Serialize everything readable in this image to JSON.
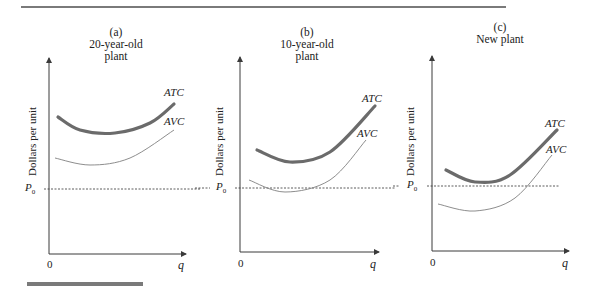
{
  "figure": {
    "panels": [
      {
        "id": "a",
        "letter": "(a)",
        "title": "20-year-old plant",
        "title_lines": [
          "20-year-old",
          "plant"
        ],
        "ylabel": "Dollars per unit",
        "price_label": "P",
        "price_sub": "0",
        "origin_label": "0",
        "xlabel": "q",
        "atc_label": "ATC",
        "avc_label": "AVC"
      },
      {
        "id": "b",
        "letter": "(b)",
        "title": "10-year-old plant",
        "title_lines": [
          "10-year-old",
          "plant"
        ],
        "ylabel": "Dollars per unit",
        "price_label": "P",
        "price_sub": "0",
        "origin_label": "0",
        "xlabel": "q",
        "atc_label": "ATC",
        "avc_label": "AVC"
      },
      {
        "id": "c",
        "letter": "(c)",
        "title": "New plant",
        "title_lines": [
          "New plant",
          ""
        ],
        "ylabel": "Dollars per unit",
        "price_label": "P",
        "price_sub": "0",
        "origin_label": "0",
        "xlabel": "q",
        "atc_label": "ATC",
        "avc_label": "AVC"
      }
    ]
  },
  "chart_data": [
    {
      "type": "line",
      "title": "(a) 20-year-old plant",
      "xlabel": "q",
      "ylabel": "Dollars per unit",
      "reference_line": {
        "label": "P0",
        "style": "dashed"
      },
      "series": [
        {
          "name": "ATC",
          "style": "thick",
          "path": [
            [
              58,
              117
            ],
            [
              80,
              130
            ],
            [
              115,
              133
            ],
            [
              150,
              123
            ],
            [
              174,
              104
            ]
          ]
        },
        {
          "name": "AVC",
          "style": "thin",
          "path": [
            [
              55,
              158
            ],
            [
              90,
              165
            ],
            [
              130,
              158
            ],
            [
              174,
              130
            ]
          ]
        }
      ],
      "note": "Both ATC and AVC lie entirely above P0"
    },
    {
      "type": "line",
      "title": "(b) 10-year-old plant",
      "xlabel": "q",
      "ylabel": "Dollars per unit",
      "reference_line": {
        "label": "P0",
        "style": "dashed"
      },
      "series": [
        {
          "name": "ATC",
          "style": "thick",
          "path": [
            [
              257,
              150
            ],
            [
              290,
              162
            ],
            [
              330,
              152
            ],
            [
              375,
              106
            ]
          ]
        },
        {
          "name": "AVC",
          "style": "thin",
          "path": [
            [
              249,
              180
            ],
            [
              285,
              192
            ],
            [
              330,
              180
            ],
            [
              366,
              140
            ]
          ]
        }
      ],
      "note": "ATC lies above P0; AVC dips slightly below P0"
    },
    {
      "type": "line",
      "title": "(c) New plant",
      "xlabel": "q",
      "ylabel": "Dollars per unit",
      "reference_line": {
        "label": "P0",
        "style": "dashed"
      },
      "series": [
        {
          "name": "ATC",
          "style": "thick",
          "path": [
            [
              446,
              170
            ],
            [
              475,
              182
            ],
            [
              510,
              175
            ],
            [
              557,
              130
            ]
          ]
        },
        {
          "name": "AVC",
          "style": "thin",
          "path": [
            [
              438,
              204
            ],
            [
              475,
              211
            ],
            [
              515,
              198
            ],
            [
              552,
              155
            ]
          ]
        }
      ],
      "note": "ATC minimum roughly at P0; AVC lies below P0 over a range of output"
    }
  ],
  "colors": {
    "atc": "#6b6b6b",
    "avc": "#7a7a7a",
    "axis": "#3a3a3a",
    "rule": "#7a7a7a"
  }
}
